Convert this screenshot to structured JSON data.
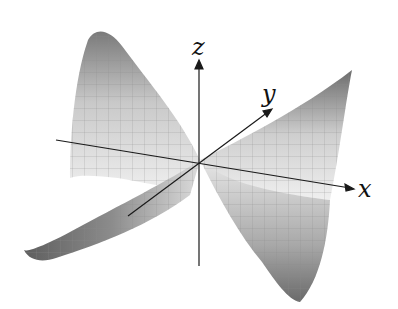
{
  "figure": {
    "surface": "z = x^2 - y^2 (saddle)",
    "axes": {
      "x": {
        "label": "x"
      },
      "y": {
        "label": "y"
      },
      "z": {
        "label": "z"
      }
    },
    "colors": {
      "background": "#ffffff",
      "surface_light": "#f2f2f2",
      "surface_dark": "#6f6f6f",
      "grid": "#8a8a8a",
      "axis": "#1a1a1a"
    }
  }
}
